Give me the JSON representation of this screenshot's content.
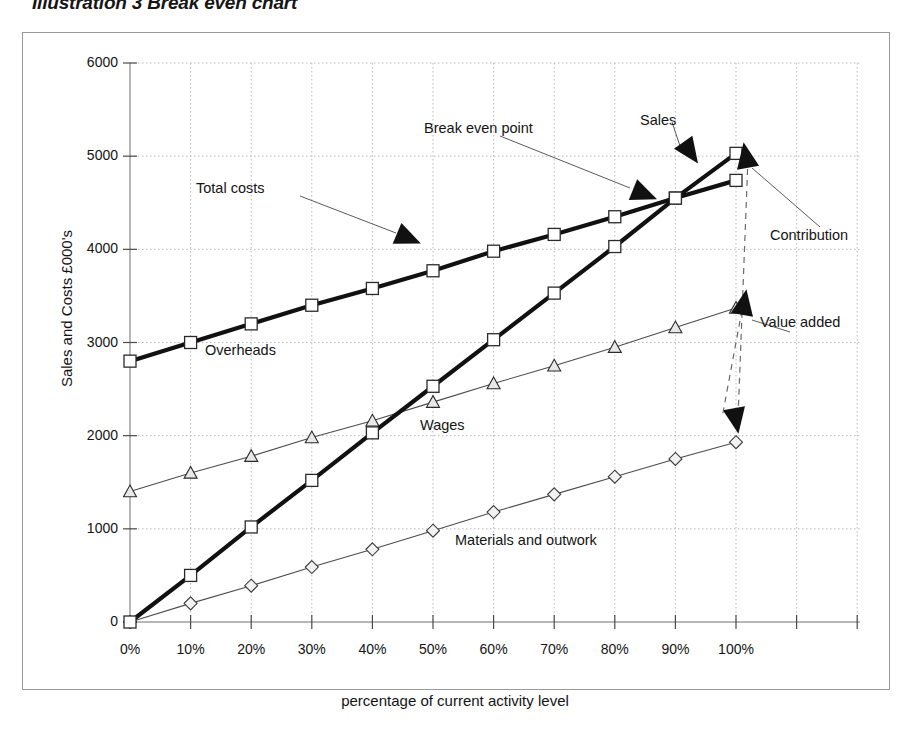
{
  "title": "Illustration 3 Break even chart",
  "axis": {
    "ylabel": "Sales and Costs £000's",
    "xlabel": "percentage of current activity level",
    "yticks": [
      "0",
      "1000",
      "2000",
      "3000",
      "4000",
      "5000",
      "6000"
    ],
    "xticks": [
      "0%",
      "10%",
      "20%",
      "30%",
      "40%",
      "50%",
      "60%",
      "70%",
      "80%",
      "90%",
      "100%"
    ]
  },
  "inline_labels": {
    "overheads": "Overheads",
    "wages": "Wages",
    "materials": "Materials and outwork"
  },
  "callouts": {
    "total_costs": "Total costs",
    "break_even_point": "Break even point",
    "sales": "Sales",
    "contribution": "Contribution",
    "value_added": "Value added"
  },
  "chart_data": {
    "type": "line",
    "title": "Illustration 3 Break even chart",
    "xlabel": "percentage of current activity level",
    "ylabel": "Sales and Costs £000's",
    "categories": [
      "0%",
      "10%",
      "20%",
      "30%",
      "40%",
      "50%",
      "60%",
      "70%",
      "80%",
      "90%",
      "100%"
    ],
    "x": [
      0,
      10,
      20,
      30,
      40,
      50,
      60,
      70,
      80,
      90,
      100
    ],
    "xlim": [
      0,
      110
    ],
    "ylim": [
      0,
      6000
    ],
    "grid": true,
    "legend": "none (inline annotations)",
    "annotations": [
      {
        "text": "Total costs",
        "points_to": "total-costs line near 55%"
      },
      {
        "text": "Break even point",
        "points_to": "crossing of sales and total costs near 88%"
      },
      {
        "text": "Sales",
        "points_to": "sales line near 95%"
      },
      {
        "text": "Contribution",
        "points_to": "gap between sales and materials at 100%"
      },
      {
        "text": "Value added",
        "points_to": "gap between wages and materials at 100%"
      },
      {
        "text": "Overheads",
        "points_to": "band between total costs and wages"
      },
      {
        "text": "Wages",
        "points_to": "band between wages and materials"
      },
      {
        "text": "Materials and outwork",
        "points_to": "band below materials line"
      }
    ],
    "series": [
      {
        "name": "Total costs",
        "marker": "square",
        "style": "heavy",
        "values": [
          2800,
          3000,
          3200,
          3400,
          3580,
          3770,
          3980,
          4160,
          4350,
          4550,
          4740
        ]
      },
      {
        "name": "Sales",
        "marker": "square",
        "style": "heavy",
        "values": [
          0,
          500,
          1020,
          1520,
          2030,
          2530,
          3030,
          3530,
          4030,
          4550,
          5030
        ]
      },
      {
        "name": "Wages",
        "marker": "triangle",
        "style": "thin",
        "values": [
          1400,
          1600,
          1780,
          1980,
          2160,
          2360,
          2560,
          2750,
          2950,
          3160,
          3370
        ]
      },
      {
        "name": "Materials and outwork",
        "marker": "diamond",
        "style": "thin",
        "values": [
          0,
          200,
          390,
          590,
          780,
          980,
          1180,
          1370,
          1560,
          1750,
          1930
        ]
      }
    ]
  }
}
